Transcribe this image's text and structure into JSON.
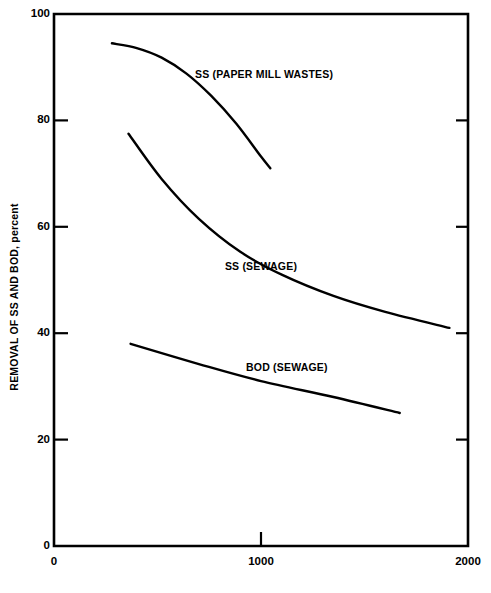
{
  "chart_data": {
    "type": "line",
    "title": "",
    "xlabel": "",
    "ylabel": "REMOVAL OF SS AND BOD, percent",
    "xlim": [
      0,
      2000
    ],
    "ylim": [
      0,
      100
    ],
    "xticks": [
      0,
      1000,
      2000
    ],
    "xtick_labels": [
      "0",
      "1000",
      "2000"
    ],
    "yticks": [
      0,
      20,
      40,
      60,
      80,
      100
    ],
    "ytick_labels": [
      "0",
      "20",
      "40",
      "60",
      "80",
      "100"
    ],
    "grid": false,
    "legend_position": "inline-annotations",
    "line_color": "#000000",
    "background_color": "#ffffff",
    "series": [
      {
        "name": "SS (PAPER MILL WASTES)",
        "label_x": 1015,
        "label_y": 88.5,
        "x": [
          280,
          400,
          520,
          640,
          760,
          880,
          1000,
          1045
        ],
        "y": [
          94.5,
          93.6,
          91.8,
          88.8,
          84.6,
          79.4,
          73.2,
          71.0
        ]
      },
      {
        "name": "SS (SEWAGE)",
        "label_x": 1000,
        "label_y": 52.5,
        "x": [
          360,
          520,
          700,
          900,
          1100,
          1350,
          1600,
          1910
        ],
        "y": [
          77.5,
          69.0,
          61.5,
          55.3,
          51.0,
          47.0,
          44.0,
          41.0
        ]
      },
      {
        "name": "BOD (SEWAGE)",
        "label_x": 1125,
        "label_y": 33.5,
        "x": [
          370,
          700,
          1000,
          1350,
          1670
        ],
        "y": [
          38.0,
          34.2,
          31.0,
          28.0,
          25.0
        ]
      }
    ]
  },
  "layout": {
    "plot_left": 54,
    "plot_right": 468,
    "plot_top": 14,
    "plot_bottom": 546
  }
}
